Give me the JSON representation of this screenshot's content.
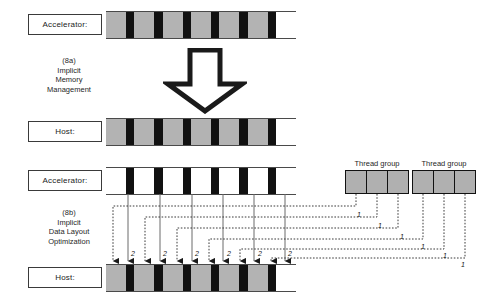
{
  "figure": {
    "rows": [
      {
        "id": "row-accel-top",
        "label": "Accelerator:",
        "bar": {
          "x": 106,
          "y": 12,
          "width": 190,
          "height": 26,
          "pattern": "alternating",
          "fill_gray": "#b3b3b3",
          "fill_black": "#111111",
          "fill_empty": "#ffffff",
          "cells": [
            "gray",
            "black",
            "gray",
            "black",
            "gray",
            "black",
            "gray",
            "black",
            "gray",
            "black",
            "gray",
            "black",
            "empty"
          ]
        }
      },
      {
        "id": "row-host-mid",
        "label": "Host:",
        "bar": {
          "x": 106,
          "y": 119,
          "width": 190,
          "height": 26,
          "pattern": "alternating",
          "fill_gray": "#b3b3b3",
          "fill_black": "#111111",
          "fill_empty": "#ffffff",
          "cells": [
            "gray",
            "black",
            "gray",
            "black",
            "gray",
            "black",
            "gray",
            "black",
            "gray",
            "black",
            "gray",
            "black",
            "empty"
          ]
        }
      },
      {
        "id": "row-accel-bottom",
        "label": "Accelerator:",
        "bar": {
          "x": 106,
          "y": 168,
          "width": 190,
          "height": 26,
          "pattern": "outlined",
          "fill_gray": "#ffffff",
          "fill_black": "#111111",
          "fill_empty": "#ffffff",
          "cells": [
            "empty",
            "black",
            "empty",
            "black",
            "empty",
            "black",
            "empty",
            "black",
            "empty",
            "black",
            "empty",
            "black",
            "empty"
          ]
        }
      },
      {
        "id": "row-host-bottom",
        "label": "Host:",
        "bar": {
          "x": 106,
          "y": 265,
          "width": 190,
          "height": 26,
          "pattern": "alternating",
          "fill_gray": "#b3b3b3",
          "fill_black": "#111111",
          "fill_empty": "#ffffff",
          "cells": [
            "gray",
            "black",
            "gray",
            "black",
            "gray",
            "black",
            "gray",
            "black",
            "gray",
            "black",
            "gray",
            "black",
            "empty"
          ]
        }
      }
    ],
    "captions": [
      {
        "id": "caption-8a",
        "lines": [
          "(8a)",
          "Implicit",
          "Memory",
          "Management"
        ],
        "text": "(8a) Implicit Memory Management",
        "x": 14,
        "y": 56
      },
      {
        "id": "caption-8b",
        "lines": [
          "(8b)",
          "Implicit",
          "Data Layout",
          "Optimization"
        ],
        "text": "(8b) Implicit Data Layout Optimization",
        "x": 14,
        "y": 208
      }
    ],
    "big_arrow": {
      "name": "down-arrow",
      "x": 163,
      "y": 48,
      "width": 84,
      "height": 66,
      "stroke": "#1a1a1a"
    },
    "thread_groups": [
      {
        "title": "Thread group",
        "cells": 3,
        "x": 345,
        "y": 170,
        "width": 64,
        "height": 24
      },
      {
        "title": "Thread group",
        "cells": 3,
        "x": 412,
        "y": 170,
        "width": 64,
        "height": 24
      }
    ],
    "thread_group_fill": "#b0b0b0",
    "wire_labels": {
      "dotted_marker": "1",
      "solid_marker": "2"
    },
    "dotted_label_positions": [
      {
        "text": "1",
        "x": 357,
        "y": 211
      },
      {
        "text": "1",
        "x": 378,
        "y": 222
      },
      {
        "text": "1",
        "x": 400,
        "y": 233
      },
      {
        "text": "1",
        "x": 421,
        "y": 243
      },
      {
        "text": "1",
        "x": 443,
        "y": 252
      },
      {
        "text": "1",
        "x": 461,
        "y": 261
      }
    ],
    "solid_label_positions": [
      {
        "text": "2",
        "x": 131,
        "y": 250
      },
      {
        "text": "2",
        "x": 163,
        "y": 250
      },
      {
        "text": "2",
        "x": 195,
        "y": 250
      },
      {
        "text": "2",
        "x": 227,
        "y": 250
      },
      {
        "text": "2",
        "x": 258,
        "y": 250
      },
      {
        "text": "2",
        "x": 288,
        "y": 250
      }
    ],
    "label_boxes": [
      {
        "id": "accel-top",
        "x": 28,
        "y": 14,
        "width": 74,
        "height": 21
      },
      {
        "id": "host-mid",
        "x": 28,
        "y": 121,
        "width": 74,
        "height": 21
      },
      {
        "id": "accel-bottom",
        "x": 28,
        "y": 170,
        "width": 74,
        "height": 21
      },
      {
        "id": "host-bottom",
        "x": 28,
        "y": 267,
        "width": 74,
        "height": 21
      }
    ],
    "colors": {
      "gray_block": "#b3b3b3",
      "black_block": "#111111",
      "outline": "#3a3a3a",
      "wire": "#5a5a5a",
      "background": "#ffffff"
    }
  }
}
